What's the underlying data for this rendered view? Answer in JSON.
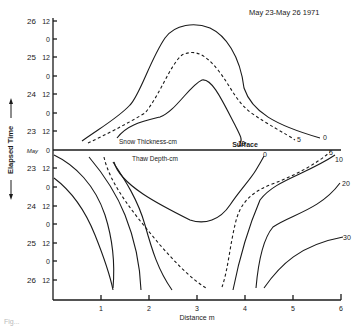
{
  "figure": {
    "date_range": "May 23-May 26  1971",
    "y_axis_label": "Elapsed Time",
    "x_axis_label": "Distance m",
    "surface_label": "Surface",
    "snow_label": "Snow Thickness-cm",
    "thaw_label": "Thaw Depth-cm",
    "month_label": "May",
    "caption_fragment": "Fig..."
  },
  "upper_axis": {
    "ticks": [
      "12",
      "0",
      "12",
      "0",
      "12",
      "0",
      "12",
      "0"
    ],
    "days": [
      "26",
      "25",
      "24",
      "23"
    ]
  },
  "lower_axis": {
    "ticks": [
      "12",
      "0",
      "12",
      "0",
      "12",
      "0",
      "12"
    ],
    "days": [
      "23",
      "24",
      "25",
      "26"
    ]
  },
  "x_axis": {
    "ticks": [
      "1",
      "2",
      "3",
      "4",
      "5",
      "6"
    ]
  },
  "snow_contours": [
    {
      "label": "0",
      "style": "solid"
    },
    {
      "label": "5",
      "style": "dashed"
    },
    {
      "label": "10",
      "style": "solid"
    }
  ],
  "thaw_contours": [
    {
      "label": "0",
      "style": "solid"
    },
    {
      "label": "5",
      "style": "dashed"
    },
    {
      "label": "10",
      "style": "solid"
    },
    {
      "label": "20",
      "style": "solid"
    },
    {
      "label": "30",
      "style": "solid"
    }
  ]
}
